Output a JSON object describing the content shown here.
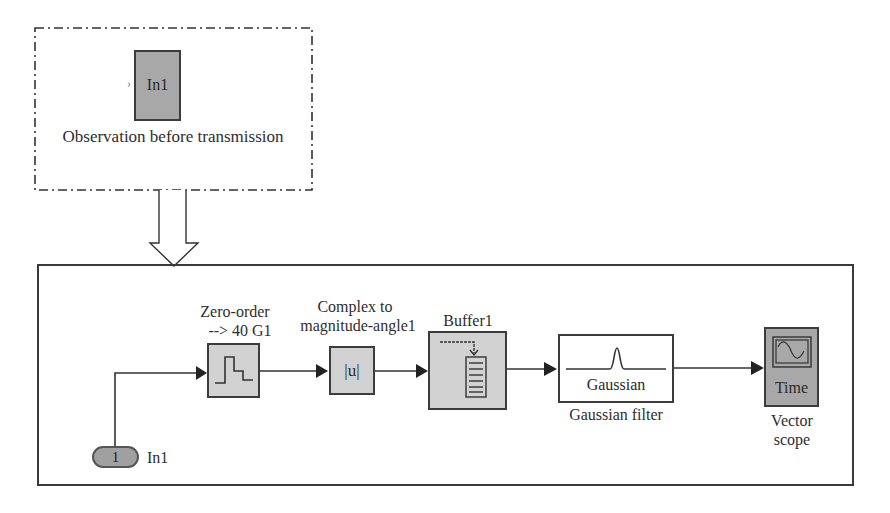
{
  "top_panel": {
    "block_label": "In1",
    "caption": "Observation before transmission"
  },
  "diagram": {
    "inport": {
      "number": "1",
      "label": "In1"
    },
    "blocks": [
      {
        "id": "zero_order",
        "title_line1": "Zero-order",
        "title_line2": "--> 40 G1",
        "icon": "staircase-icon"
      },
      {
        "id": "complex_to_mag",
        "title_line1": "Complex to",
        "title_line2": "magnitude-angle1",
        "inner_text": "|u|"
      },
      {
        "id": "buffer",
        "title": "Buffer1",
        "icon": "buffer-icon"
      },
      {
        "id": "gaussian",
        "inner_text": "Gaussian",
        "caption": "Gaussian filter",
        "icon": "gaussian-pulse-icon"
      },
      {
        "id": "vector_scope",
        "inner_text": "Time",
        "caption_line1": "Vector",
        "caption_line2": "scope",
        "icon": "scope-icon"
      }
    ]
  },
  "colors": {
    "line": "#333333",
    "block_light": "#d2d2d2",
    "block_dark": "#a8a8a8"
  }
}
